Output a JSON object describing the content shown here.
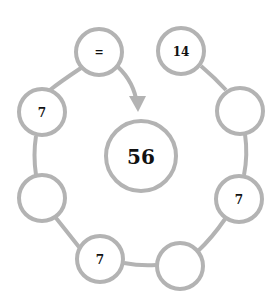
{
  "diagram": {
    "colors": {
      "stroke": "#b3b3b3",
      "text": "#111111",
      "background": "#ffffff"
    },
    "center": {
      "label": "56"
    },
    "nodes": [
      {
        "id": "n-equals",
        "label": "="
      },
      {
        "id": "n-14",
        "label": "14"
      },
      {
        "id": "n-right-upper",
        "label": ""
      },
      {
        "id": "n-right-7",
        "label": "7"
      },
      {
        "id": "n-bottom-right",
        "label": ""
      },
      {
        "id": "n-bottom-7",
        "label": "7"
      },
      {
        "id": "n-left-lower",
        "label": ""
      },
      {
        "id": "n-left-7",
        "label": "7"
      }
    ],
    "arrow": {
      "from": "=",
      "to": "56"
    }
  }
}
